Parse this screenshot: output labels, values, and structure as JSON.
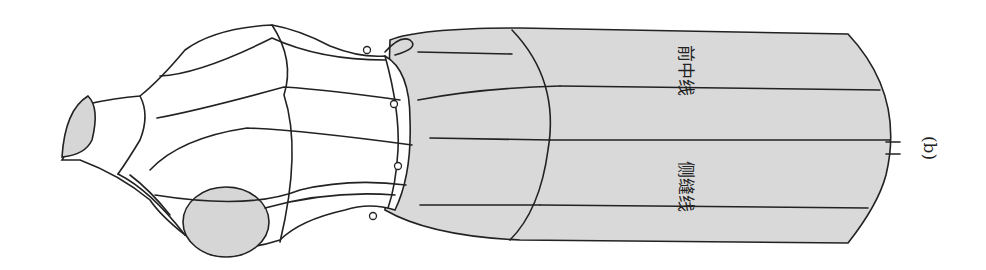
{
  "figure": {
    "panel_label": "(b)",
    "labels": {
      "front_center_line": "前中线",
      "side_seam_line": "侧缝线"
    }
  },
  "colors": {
    "fabric": "#d9d9d9",
    "line": "#222222",
    "background": "#ffffff"
  }
}
